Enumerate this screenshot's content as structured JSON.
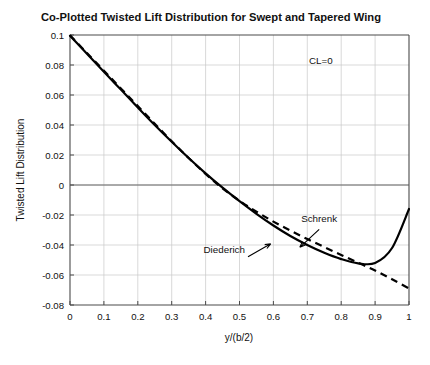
{
  "chart_data": {
    "type": "line",
    "title": "Co-Plotted Twisted Lift Distribution for Swept and Tapered Wing",
    "xlabel": "y/(b/2)",
    "ylabel": "Twisted Lift Distribution",
    "xlim": [
      0,
      1
    ],
    "ylim": [
      -0.08,
      0.1
    ],
    "xticks": [
      "0",
      "0.1",
      "0.2",
      "0.3",
      "0.4",
      "0.5",
      "0.6",
      "0.7",
      "0.8",
      "0.9",
      "1"
    ],
    "xtick_values": [
      0,
      0.1,
      0.2,
      0.3,
      0.4,
      0.5,
      0.6,
      0.7,
      0.8,
      0.9,
      1
    ],
    "yticks": [
      "0.1",
      "0.08",
      "0.06",
      "0.04",
      "0.02",
      "0",
      "-0.02",
      "-0.04",
      "-0.06",
      "-0.08"
    ],
    "ytick_values": [
      0.1,
      0.08,
      0.06,
      0.04,
      0.02,
      0,
      -0.02,
      -0.04,
      -0.06,
      -0.08
    ],
    "grid": true,
    "legend_position": "inline-annotations",
    "annotations": [
      {
        "label": "CL=0",
        "x": 0.74,
        "y": 0.0805
      },
      {
        "label": "Schrenk",
        "x": 0.735,
        "y": -0.0245
      },
      {
        "label": "Diederich",
        "x": 0.455,
        "y": -0.0455
      }
    ],
    "x": [
      0,
      0.05,
      0.1,
      0.15,
      0.2,
      0.25,
      0.3,
      0.35,
      0.4,
      0.45,
      0.5,
      0.55,
      0.6,
      0.65,
      0.7,
      0.75,
      0.8,
      0.85,
      0.9,
      0.95,
      1
    ],
    "series": [
      {
        "name": "Diederich",
        "style": "solid",
        "values": [
          0.0995,
          0.0875,
          0.0755,
          0.0636,
          0.0517,
          0.04,
          0.0288,
          0.018,
          0.0078,
          -0.0018,
          -0.0108,
          -0.0192,
          -0.027,
          -0.034,
          -0.04,
          -0.0452,
          -0.0494,
          -0.0522,
          -0.052,
          -0.042,
          -0.016
        ]
      },
      {
        "name": "Schrenk",
        "style": "dashed",
        "values": [
          0.0998,
          0.088,
          0.0762,
          0.0644,
          0.0526,
          0.0408,
          0.0292,
          0.018,
          0.0074,
          -0.0022,
          -0.0105,
          -0.0178,
          -0.0244,
          -0.0304,
          -0.036,
          -0.0414,
          -0.0466,
          -0.0518,
          -0.057,
          -0.0628,
          -0.069
        ]
      }
    ]
  }
}
